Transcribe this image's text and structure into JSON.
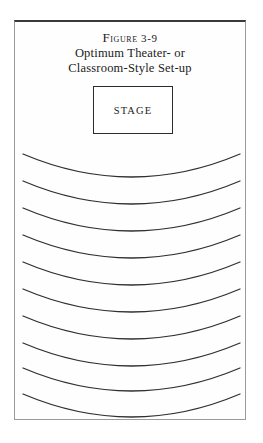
{
  "figure": {
    "number_label": "Figure 3-9",
    "caption_line_1": "Optimum Theater- or",
    "caption_line_2": "Classroom-Style Set-up"
  },
  "stage": {
    "label": "STAGE"
  },
  "seating": {
    "row_count": 10,
    "description": "curved rows of seating arcs facing the stage",
    "rows": [
      {
        "index": 1,
        "end_y": 132,
        "sag_y": 155
      },
      {
        "index": 2,
        "end_y": 159,
        "sag_y": 182
      },
      {
        "index": 3,
        "end_y": 186,
        "sag_y": 209
      },
      {
        "index": 4,
        "end_y": 213,
        "sag_y": 236
      },
      {
        "index": 5,
        "end_y": 240,
        "sag_y": 263
      },
      {
        "index": 6,
        "end_y": 267,
        "sag_y": 290
      },
      {
        "index": 7,
        "end_y": 294,
        "sag_y": 317
      },
      {
        "index": 8,
        "end_y": 321,
        "sag_y": 344
      },
      {
        "index": 9,
        "end_y": 346,
        "sag_y": 369
      },
      {
        "index": 10,
        "end_y": 372,
        "sag_y": 395
      }
    ],
    "x_start": 8,
    "x_end": 225
  },
  "colors": {
    "ink": "#2f2f2f",
    "frame_top": "#3a3a3a",
    "frame_side": "#9a9a9a",
    "page_background": "#ffffff"
  }
}
